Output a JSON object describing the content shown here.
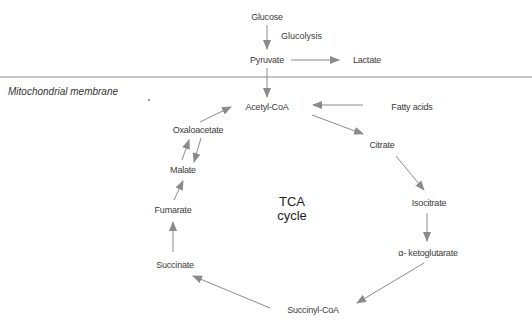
{
  "diagram": {
    "title": "TCA cycle",
    "membrane_label": "Mitochondrial membrane",
    "colors": {
      "arrow": "#8a8a8a",
      "line": "#8a8a8a",
      "text": "#3a3a3a"
    },
    "nodes": {
      "glucose": "Glucose",
      "glucolysis": "Glucolysis",
      "pyruvate": "Pyruvate",
      "lactate": "Lactate",
      "acetyl_coa": "Acetyl-CoA",
      "fatty_acids": "Fatty acids",
      "oxaloacetate": "Oxaloacetate",
      "citrate": "Citrate",
      "malate": "Malate",
      "isocitrate": "Isocitrate",
      "fumarate": "Fumarate",
      "alpha_ketoglutarate": "α- ketoglutarate",
      "succinate": "Succinate",
      "succinyl_coa": "Succinyl-CoA"
    },
    "center_label": {
      "line1": "TCA",
      "line2": "cycle"
    },
    "edges": [
      [
        "Glucose",
        "Pyruvate"
      ],
      [
        "Pyruvate",
        "Lactate"
      ],
      [
        "Pyruvate",
        "Acetyl-CoA"
      ],
      [
        "Fatty acids",
        "Acetyl-CoA"
      ],
      [
        "Acetyl-CoA",
        "Citrate"
      ],
      [
        "Citrate",
        "Isocitrate"
      ],
      [
        "Isocitrate",
        "α- ketoglutarate"
      ],
      [
        "α- ketoglutarate",
        "Succinyl-CoA"
      ],
      [
        "Succinyl-CoA",
        "Succinate"
      ],
      [
        "Succinate",
        "Fumarate"
      ],
      [
        "Fumarate",
        "Malate"
      ],
      [
        "Malate",
        "Oxaloacetate"
      ],
      [
        "Oxaloacetate",
        "Malate"
      ],
      [
        "Oxaloacetate",
        "Acetyl-CoA"
      ]
    ]
  }
}
